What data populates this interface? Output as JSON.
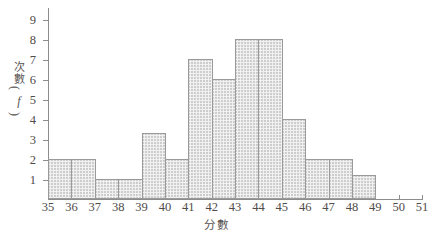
{
  "chart_data": {
    "type": "bar",
    "title": "",
    "subtitle": "",
    "xlabel": "分數",
    "ylabel_lines": [
      "次",
      "數"
    ],
    "ylabel_unit": "f",
    "ylabel_paren_open": "(",
    "ylabel_paren_close": ")",
    "xlabel_full": "分數",
    "ylabel_full": "次數（f）",
    "grid": false,
    "legend": null,
    "xlim": [
      35,
      51
    ],
    "ylim": [
      0,
      9.6
    ],
    "x_ticks": [
      35,
      36,
      37,
      38,
      39,
      40,
      41,
      42,
      43,
      44,
      45,
      46,
      47,
      48,
      49,
      50,
      51
    ],
    "x_tick_labels": [
      "35",
      "36",
      "37",
      "38",
      "39",
      "40",
      "41",
      "42",
      "43",
      "44",
      "45",
      "46",
      "47",
      "48",
      "49",
      "50",
      "51"
    ],
    "y_ticks": [
      1,
      2,
      3,
      4,
      5,
      6,
      7,
      8,
      9
    ],
    "y_tick_labels": [
      "1",
      "2",
      "3",
      "4",
      "5",
      "6",
      "7",
      "8",
      "9"
    ],
    "bin_width": 1,
    "categories": [
      "35-36",
      "36-37",
      "37-38",
      "38-39",
      "39-40",
      "40-41",
      "41-42",
      "42-43",
      "43-44",
      "44-45",
      "45-46",
      "46-47",
      "47-48",
      "48-49"
    ],
    "bin_starts": [
      35,
      36,
      37,
      38,
      39,
      40,
      41,
      42,
      43,
      44,
      45,
      46,
      47,
      48
    ],
    "values": [
      2,
      2,
      1,
      1,
      3.3,
      2,
      7,
      6,
      8,
      8,
      4,
      2,
      2,
      1.2
    ],
    "bar_face_color": "#f1f1f1",
    "bar_edge_color": "#9a9a9a",
    "axis_color": "#8d8d8d",
    "text_color": "#4f4b49",
    "background_color": "#ffffff"
  }
}
